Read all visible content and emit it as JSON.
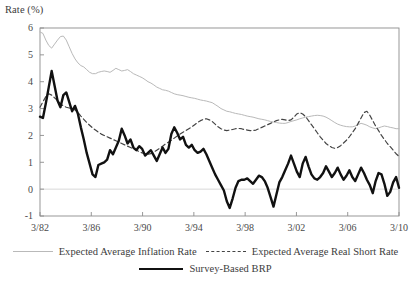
{
  "axis": {
    "ylabel": "Rate (%)",
    "y_ticks": [
      "-1",
      "0",
      "1",
      "2",
      "3",
      "4",
      "5",
      "6"
    ],
    "y_tick_values": [
      -1,
      0,
      1,
      2,
      3,
      4,
      5,
      6
    ],
    "x_ticks": [
      "3/82",
      "3/86",
      "3/90",
      "3/94",
      "3/98",
      "3/02",
      "3/06",
      "3/10"
    ],
    "x_tick_values": [
      1982.17,
      1986.17,
      1990.17,
      1994.17,
      1998.17,
      2002.17,
      2006.17,
      2010.17
    ]
  },
  "legend": {
    "items": [
      {
        "label": "Expected Average Inflation Rate",
        "style": "solid-thin",
        "color": "#b9b9b9"
      },
      {
        "label": "Expected Average Real Short Rate",
        "style": "dashed",
        "color": "#444444"
      },
      {
        "label": "Survey-Based BRP",
        "style": "solid-thick",
        "color": "#111111"
      }
    ]
  },
  "colors": {
    "inflation": "#b9b9b9",
    "real_short_rate": "#444444",
    "brp": "#111111",
    "frame": "#8c8c8c",
    "zero_line": "#d8d8d8",
    "text": "#3c3c3c"
  },
  "chart_data": {
    "type": "line",
    "title": "",
    "subtitle": "",
    "xlabel": "",
    "ylabel": "Rate (%)",
    "xlim": [
      1982.17,
      2010.17
    ],
    "ylim": [
      -1,
      6
    ],
    "grid": false,
    "legend_position": "bottom",
    "x_tick_labels": [
      "3/82",
      "3/86",
      "3/90",
      "3/94",
      "3/98",
      "3/02",
      "3/06",
      "3/10"
    ],
    "x_start": 1982.17,
    "x_step": 0.25,
    "x_note": "quarterly observations beginning 1982Q1 (3/82) through 2010Q1 (3/10)",
    "series": [
      {
        "name": "Expected Average Inflation Rate",
        "color": "#b9b9b9",
        "style": "solid",
        "width": 1,
        "values": [
          5.85,
          5.8,
          5.55,
          5.35,
          5.25,
          5.4,
          5.55,
          5.68,
          5.7,
          5.55,
          5.3,
          5.05,
          4.85,
          4.7,
          4.6,
          4.55,
          4.45,
          4.35,
          4.3,
          4.3,
          4.35,
          4.38,
          4.4,
          4.38,
          4.35,
          4.42,
          4.5,
          4.45,
          4.4,
          4.42,
          4.45,
          4.38,
          4.3,
          4.25,
          4.2,
          4.15,
          4.08,
          4.0,
          3.95,
          3.88,
          3.8,
          3.75,
          3.7,
          3.68,
          3.65,
          3.6,
          3.55,
          3.52,
          3.5,
          3.48,
          3.45,
          3.42,
          3.4,
          3.38,
          3.35,
          3.32,
          3.3,
          3.28,
          3.25,
          3.22,
          3.15,
          3.08,
          3.0,
          2.95,
          2.9,
          2.88,
          2.85,
          2.82,
          2.8,
          2.78,
          2.75,
          2.72,
          2.7,
          2.68,
          2.65,
          2.62,
          2.6,
          2.58,
          2.55,
          2.52,
          2.5,
          2.48,
          2.46,
          2.45,
          2.45,
          2.48,
          2.52,
          2.55,
          2.58,
          2.62,
          2.65,
          2.68,
          2.7,
          2.72,
          2.74,
          2.75,
          2.74,
          2.72,
          2.68,
          2.62,
          2.55,
          2.48,
          2.42,
          2.38,
          2.35,
          2.33,
          2.32,
          2.32,
          2.35,
          2.4,
          2.45,
          2.42,
          2.38,
          2.32,
          2.28,
          2.25,
          2.28,
          2.32,
          2.35,
          2.33,
          2.3,
          2.28,
          2.25,
          2.25
        ]
      },
      {
        "name": "Expected Average Real Short Rate",
        "color": "#444444",
        "style": "dashed",
        "width": 1.2,
        "values": [
          3.05,
          3.25,
          3.45,
          3.55,
          3.5,
          3.4,
          3.3,
          3.18,
          3.1,
          3.05,
          3.02,
          3.0,
          2.95,
          2.85,
          2.72,
          2.6,
          2.48,
          2.38,
          2.28,
          2.2,
          2.12,
          2.05,
          2.0,
          1.95,
          1.9,
          1.85,
          1.8,
          1.75,
          1.7,
          1.65,
          1.6,
          1.55,
          1.5,
          1.45,
          1.4,
          1.35,
          1.32,
          1.3,
          1.32,
          1.38,
          1.45,
          1.52,
          1.6,
          1.68,
          1.75,
          1.82,
          1.9,
          1.98,
          2.05,
          2.12,
          2.18,
          2.25,
          2.32,
          2.4,
          2.48,
          2.55,
          2.6,
          2.62,
          2.58,
          2.52,
          2.42,
          2.32,
          2.25,
          2.2,
          2.18,
          2.2,
          2.22,
          2.25,
          2.26,
          2.25,
          2.22,
          2.2,
          2.18,
          2.18,
          2.2,
          2.25,
          2.3,
          2.35,
          2.4,
          2.45,
          2.5,
          2.55,
          2.58,
          2.6,
          2.58,
          2.55,
          2.58,
          2.68,
          2.8,
          2.85,
          2.8,
          2.7,
          2.55,
          2.4,
          2.25,
          2.1,
          1.95,
          1.82,
          1.7,
          1.62,
          1.55,
          1.52,
          1.55,
          1.62,
          1.72,
          1.82,
          1.95,
          2.1,
          2.25,
          2.45,
          2.65,
          2.85,
          2.9,
          2.75,
          2.55,
          2.35,
          2.18,
          2.0,
          1.85,
          1.7,
          1.58,
          1.45,
          1.32,
          1.22
        ]
      },
      {
        "name": "Survey-Based BRP",
        "color": "#111111",
        "style": "solid",
        "width": 2.4,
        "values": [
          2.7,
          2.65,
          3.2,
          3.8,
          4.4,
          3.85,
          3.3,
          3.05,
          3.5,
          3.6,
          3.25,
          2.9,
          3.1,
          2.8,
          2.3,
          1.85,
          1.35,
          0.95,
          0.55,
          0.45,
          0.9,
          0.95,
          1.0,
          1.1,
          1.45,
          1.3,
          1.55,
          1.8,
          2.25,
          2.0,
          1.7,
          1.85,
          1.55,
          1.45,
          1.6,
          1.5,
          1.25,
          1.35,
          1.45,
          1.25,
          1.05,
          1.3,
          1.55,
          1.35,
          1.5,
          2.05,
          2.3,
          2.1,
          1.85,
          1.95,
          1.65,
          1.55,
          1.65,
          1.45,
          1.35,
          1.4,
          1.5,
          1.3,
          1.05,
          0.8,
          0.55,
          0.35,
          0.15,
          -0.05,
          -0.45,
          -0.7,
          -0.35,
          0.05,
          0.3,
          0.35,
          0.35,
          0.4,
          0.3,
          0.2,
          0.35,
          0.5,
          0.45,
          0.3,
          0.05,
          -0.3,
          -0.65,
          -0.2,
          0.25,
          0.45,
          0.7,
          0.95,
          1.25,
          0.95,
          0.65,
          0.45,
          0.95,
          1.2,
          0.85,
          0.55,
          0.4,
          0.35,
          0.45,
          0.6,
          0.85,
          0.65,
          0.45,
          0.6,
          0.8,
          0.55,
          0.35,
          0.5,
          0.7,
          0.45,
          0.3,
          0.55,
          0.8,
          0.6,
          0.35,
          0.15,
          -0.15,
          0.3,
          0.6,
          0.55,
          0.2,
          -0.25,
          -0.1,
          0.25,
          0.45,
          0.05
        ]
      }
    ]
  }
}
